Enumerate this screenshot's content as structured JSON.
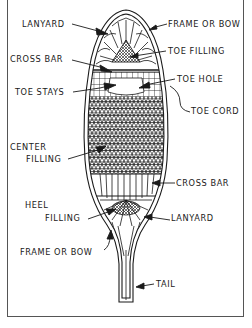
{
  "diagram": {
    "colors": {
      "ink": "#1a1a1a",
      "border": "#555555",
      "background": "#ffffff"
    },
    "labels": {
      "lanyard_top": "LANYARD",
      "frame_top": "FRAME OR BOW",
      "toe_filling": "TOE FILLING",
      "cross_bar_top": "CROSS BAR",
      "toe_hole": "TOE HOLE",
      "toe_stays": "TOE STAYS",
      "toe_cord": "TOE CORD",
      "center_filling_1": "CENTER",
      "center_filling_2": "FILLING",
      "cross_bar_bottom": "CROSS BAR",
      "heel_filling_1": "HEEL",
      "heel_filling_2": "FILLING",
      "lanyard_bottom": "LANYARD",
      "frame_bottom": "FRAME OR BOW",
      "tail": "TAIL"
    }
  }
}
